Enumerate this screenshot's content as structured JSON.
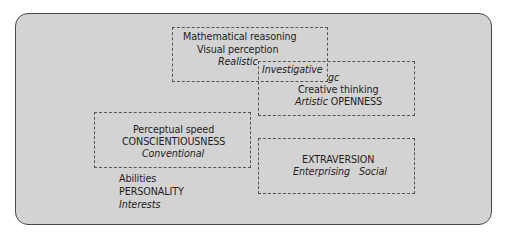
{
  "diagram": {
    "clusters": [
      {
        "id": "realistic-cluster",
        "lines": {
          "ability1": "Mathematical reasoning",
          "ability2": "Visual perception",
          "interest": "Realistic"
        }
      },
      {
        "id": "openness-cluster",
        "lines": {
          "interest_investigative": "Investigative",
          "ability_gc": "gc",
          "ability_creative": "Creative thinking",
          "interest_artistic": "Artistic",
          "personality": "OPENNESS"
        }
      },
      {
        "id": "conscientiousness-cluster",
        "lines": {
          "ability": "Perceptual speed",
          "personality": "CONSCIENTIOUSNESS",
          "interest": "Conventional"
        }
      },
      {
        "id": "extraversion-cluster",
        "lines": {
          "personality": "EXTRAVERSION",
          "interest_enterprising": "Enterprising",
          "interest_social": "Social"
        }
      }
    ],
    "legend": {
      "abilities": "Abilities",
      "personality": "PERSONALITY",
      "interests": "Interests"
    },
    "colors": {
      "panel_background": "#d3d3d3",
      "panel_border": "#4a4a4a",
      "dashed_border": "#555555",
      "text": "#1e1e1e"
    }
  }
}
